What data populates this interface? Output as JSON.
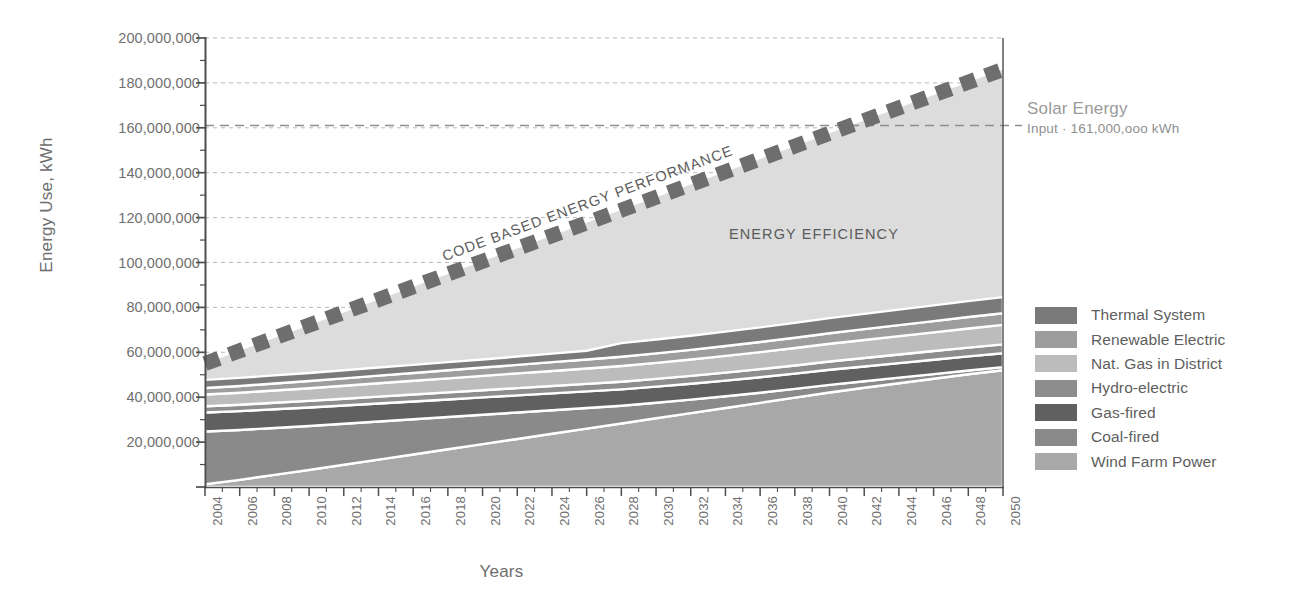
{
  "axes": {
    "ylabel": "Energy Use, kWh",
    "xlabel": "Years",
    "yticks": [
      "200,000,000",
      "180,000,000",
      "160,000,000",
      "140,000,000",
      "120,000,000",
      "100,000,000",
      "80,000,000",
      "60,000,000",
      "40,000,000",
      "20,000,000"
    ],
    "xticks": [
      "2004",
      "2006",
      "2008",
      "2010",
      "2012",
      "2014",
      "2016",
      "2018",
      "2020",
      "2022",
      "2024",
      "2026",
      "2028",
      "2030",
      "2032",
      "2034",
      "2036",
      "2038",
      "2040",
      "2042",
      "2044",
      "2046",
      "2048",
      "2050"
    ]
  },
  "annotations": {
    "code_based": "CODE BASED ENERGY PERFORMANCE",
    "energy_efficiency": "ENERGY EFFICIENCY",
    "solar_title": "Solar Energy",
    "solar_subtitle": "Input · 161,000,ooo kWh"
  },
  "legend": {
    "items": [
      {
        "label": "Thermal System",
        "color": "#7a7a7a"
      },
      {
        "label": "Renewable Electric",
        "color": "#9d9d9d"
      },
      {
        "label": "Nat. Gas in District",
        "color": "#bcbcbc"
      },
      {
        "label": "Hydro-electric",
        "color": "#8d8d8d"
      },
      {
        "label": "Gas-fired",
        "color": "#606060"
      },
      {
        "label": "Coal-fired",
        "color": "#8a8a8a"
      },
      {
        "label": "Wind Farm Power",
        "color": "#a8a8a8"
      }
    ]
  },
  "chart_data": {
    "type": "area",
    "title": "",
    "xlabel": "Years",
    "ylabel": "Energy Use, kWh",
    "xlim": [
      2004,
      2050
    ],
    "ylim": [
      0,
      200000000
    ],
    "ytick_step": 20000000,
    "grid": true,
    "legend_position": "right",
    "stacked": true,
    "x": [
      2004,
      2006,
      2008,
      2010,
      2012,
      2014,
      2016,
      2018,
      2020,
      2022,
      2024,
      2026,
      2028,
      2030,
      2032,
      2034,
      2036,
      2038,
      2040,
      2042,
      2044,
      2046,
      2048,
      2050
    ],
    "series": [
      {
        "name": "Wind Farm Power",
        "color": "#a8a8a8",
        "values": [
          1200000,
          3200000,
          5400000,
          7600000,
          9900000,
          12200000,
          14500000,
          16800000,
          19100000,
          21400000,
          23700000,
          26000000,
          28300000,
          30600000,
          32900000,
          35200000,
          37500000,
          39800000,
          42100000,
          44200000,
          46200000,
          48200000,
          50200000,
          52000000
        ]
      },
      {
        "name": "Coal-fired",
        "color": "#8a8a8a",
        "values": [
          23500000,
          22200000,
          20900000,
          19600000,
          18300000,
          17000000,
          15700000,
          14400000,
          13100000,
          11800000,
          10500000,
          9200000,
          7900000,
          6900000,
          6000000,
          5200000,
          4500000,
          3900000,
          3400000,
          2900000,
          2500000,
          2100000,
          1700000,
          1400000
        ]
      },
      {
        "name": "Gas-fired",
        "color": "#606060",
        "values": [
          8500000,
          8400000,
          8300000,
          8200000,
          8100000,
          8000000,
          7900000,
          7800000,
          7700000,
          7600000,
          7500000,
          7400000,
          7300000,
          7200000,
          7100000,
          7000000,
          6900000,
          6800000,
          6700000,
          6600000,
          6500000,
          6400000,
          6300000,
          6200000
        ]
      },
      {
        "name": "Hydro-electric",
        "color": "#8d8d8d",
        "values": [
          2800000,
          2850000,
          2900000,
          2950000,
          3000000,
          3050000,
          3100000,
          3150000,
          3200000,
          3250000,
          3300000,
          3350000,
          3400000,
          3450000,
          3500000,
          3550000,
          3600000,
          3650000,
          3700000,
          3750000,
          3800000,
          3850000,
          3900000,
          3950000
        ]
      },
      {
        "name": "Nat. Gas in District",
        "color": "#bcbcbc",
        "values": [
          5200000,
          5350000,
          5500000,
          5650000,
          5800000,
          5950000,
          6100000,
          6250000,
          6400000,
          6550000,
          6700000,
          6850000,
          7000000,
          7150000,
          7300000,
          7450000,
          7600000,
          7750000,
          7900000,
          8050000,
          8200000,
          8350000,
          8500000,
          8650000
        ]
      },
      {
        "name": "Renewable Electric",
        "color": "#9d9d9d",
        "values": [
          2900000,
          3000000,
          3100000,
          3200000,
          3300000,
          3400000,
          3500000,
          3600000,
          3700000,
          3800000,
          3900000,
          4000000,
          4100000,
          4200000,
          4300000,
          4400000,
          4500000,
          4600000,
          4700000,
          4800000,
          4900000,
          5000000,
          5100000,
          5200000
        ]
      },
      {
        "name": "Thermal System",
        "color": "#7a7a7a",
        "values": [
          3600000,
          3600000,
          3600000,
          3600000,
          3600000,
          3600000,
          3600000,
          3600000,
          3600000,
          3700000,
          3800000,
          3900000,
          6100000,
          6200000,
          6300000,
          6400000,
          6500000,
          6600000,
          6700000,
          6800000,
          6900000,
          7000000,
          7100000,
          7200000
        ]
      }
    ],
    "overlays": [
      {
        "name": "Code Based Energy Performance",
        "type": "dashed-line",
        "style": "thick-square-dash",
        "color": "#6e6e6e",
        "x": [
          2004,
          2050
        ],
        "y": [
          55000000,
          186000000
        ],
        "label": "CODE BASED ENERGY PERFORMANCE"
      },
      {
        "name": "Energy Efficiency Region",
        "type": "filled-region",
        "color": "#dcdcdc",
        "label": "ENERGY EFFICIENCY",
        "description": "area between stacked total and code-based energy performance line"
      },
      {
        "name": "Solar Energy Input",
        "type": "reference-line",
        "color": "#9a9a9a",
        "y": 161000000,
        "label": "Solar Energy",
        "sublabel": "Input · 161,000,ooo kWh"
      }
    ]
  }
}
